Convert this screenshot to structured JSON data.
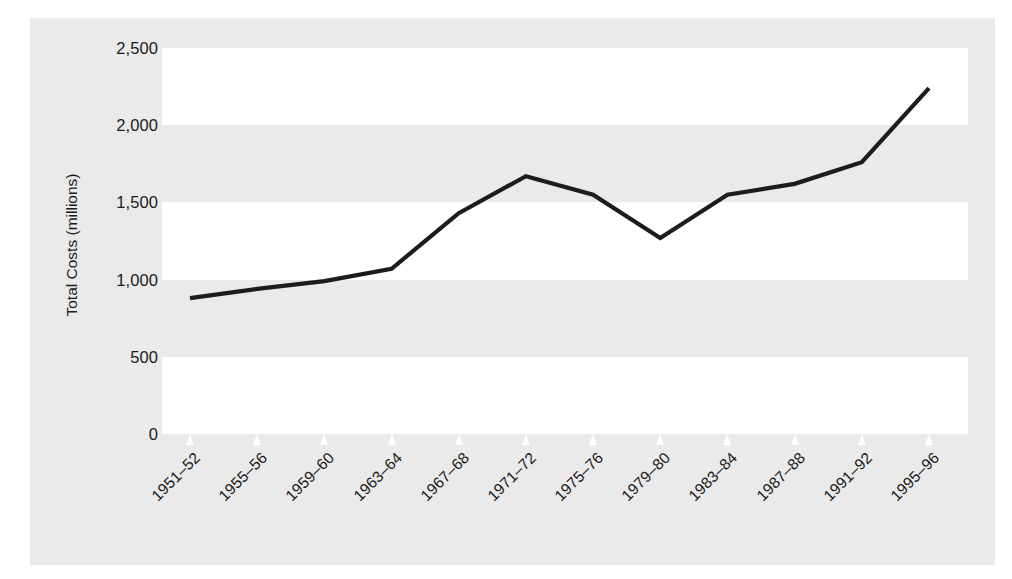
{
  "chart_data": {
    "type": "line",
    "title": "",
    "xlabel": "",
    "ylabel": "Total Costs (millions)",
    "categories": [
      "1951–52",
      "1955–56",
      "1959–60",
      "1963–64",
      "1967–68",
      "1971–72",
      "1975–76",
      "1979–80",
      "1983–84",
      "1987–88",
      "1991–92",
      "1995–96"
    ],
    "values": [
      880,
      940,
      990,
      1070,
      1430,
      1670,
      1550,
      1270,
      1550,
      1620,
      1760,
      2240
    ],
    "series": [
      {
        "name": "Total Costs",
        "values": [
          880,
          940,
          990,
          1070,
          1430,
          1670,
          1550,
          1270,
          1550,
          1620,
          1760,
          2240
        ]
      }
    ],
    "ylim": [
      0,
      2500
    ],
    "yticks": [
      0,
      500,
      1000,
      1500,
      2000,
      2500
    ],
    "ytick_labels": [
      "0",
      "500",
      "1,000",
      "1,500",
      "2,000",
      "2,500"
    ],
    "grid": "horizontal-bands",
    "legend": "none",
    "line_color": "#1c1c1c",
    "band_color": "#ffffff",
    "panel_color": "#eaeaea"
  },
  "axis": {
    "y_title": "Total Costs (millions)",
    "y_labels": [
      "2,500",
      "2,000",
      "1,500",
      "1,000",
      "500",
      "0"
    ],
    "x_labels": [
      "1951–52",
      "1955–56",
      "1959–60",
      "1963–64",
      "1967–68",
      "1971–72",
      "1975–76",
      "1979–80",
      "1983–84",
      "1987–88",
      "1991–92",
      "1995–96"
    ]
  }
}
